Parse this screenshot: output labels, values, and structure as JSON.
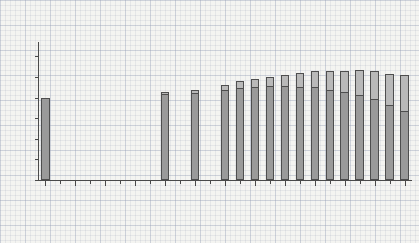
{
  "title": {
    "line1": "Household waste and recycling",
    "line2": "1983/4 - 2007/8"
  },
  "axis_caption": {
    "line1": "Kilograms per person",
    "line2": "per year"
  },
  "legend": {
    "position": "top-right",
    "items": [
      {
        "label": "Waste recycled/composted",
        "color": "#b9b9b9"
      },
      {
        "label": "Waste not recycled/composted",
        "color": "#9a9a9a"
      }
    ]
  },
  "chart_data": {
    "type": "bar",
    "xlabel": "",
    "ylabel": "Kilograms per person per year",
    "ylim": [
      0,
      650
    ],
    "yticks": [
      "0",
      "100",
      "200",
      "300",
      "400",
      "500",
      "600"
    ],
    "ytick_values": [
      0,
      100,
      200,
      300,
      400,
      500,
      600
    ],
    "grid": true,
    "stacked": true,
    "categories": [
      "1983/84",
      "1984/85",
      "1985/86",
      "1986/87",
      "1987/88",
      "1988/89",
      "1989/90",
      "1990/91",
      "1991/92",
      "1992/93",
      "1993/94",
      "1994/95",
      "1995/96",
      "1996/97",
      "1997/98",
      "1998/99",
      "1999/00",
      "2000/01",
      "2001/02",
      "2002/03",
      "2003/04",
      "2004/05",
      "2005/06",
      "2006/07",
      "2007/08"
    ],
    "xtick_labels": [
      "1983/84",
      "1985/86",
      "1987/88",
      "1989/90",
      "1991/92",
      "1993/94",
      "1995/96",
      "19897/98",
      "1999/00",
      "2001/02",
      "2003/04",
      "2005/06",
      "2007/08"
    ],
    "series": [
      {
        "name": "Waste not recycled/composted",
        "color": "#9a9a9a",
        "values": [
          397,
          null,
          null,
          null,
          null,
          null,
          null,
          null,
          415,
          null,
          424,
          null,
          437,
          447,
          450,
          455,
          455,
          452,
          450,
          438,
          425,
          412,
          392,
          365,
          337
        ]
      },
      {
        "name": "Waste recycled/composted",
        "color": "#b9b9b9",
        "values": [
          0,
          null,
          null,
          null,
          null,
          null,
          null,
          null,
          10,
          null,
          14,
          null,
          24,
          33,
          40,
          46,
          55,
          65,
          80,
          90,
          105,
          120,
          135,
          150,
          172
        ]
      }
    ],
    "totals": [
      397,
      null,
      null,
      null,
      null,
      null,
      null,
      null,
      425,
      null,
      438,
      null,
      461,
      480,
      490,
      501,
      510,
      517,
      530,
      528,
      530,
      532,
      527,
      515,
      509
    ],
    "missing_years": [
      "1984/85",
      "1985/86",
      "1986/87",
      "1987/88",
      "1988/89",
      "1989/90",
      "1990/91",
      "1992/93",
      "1994/95"
    ]
  }
}
